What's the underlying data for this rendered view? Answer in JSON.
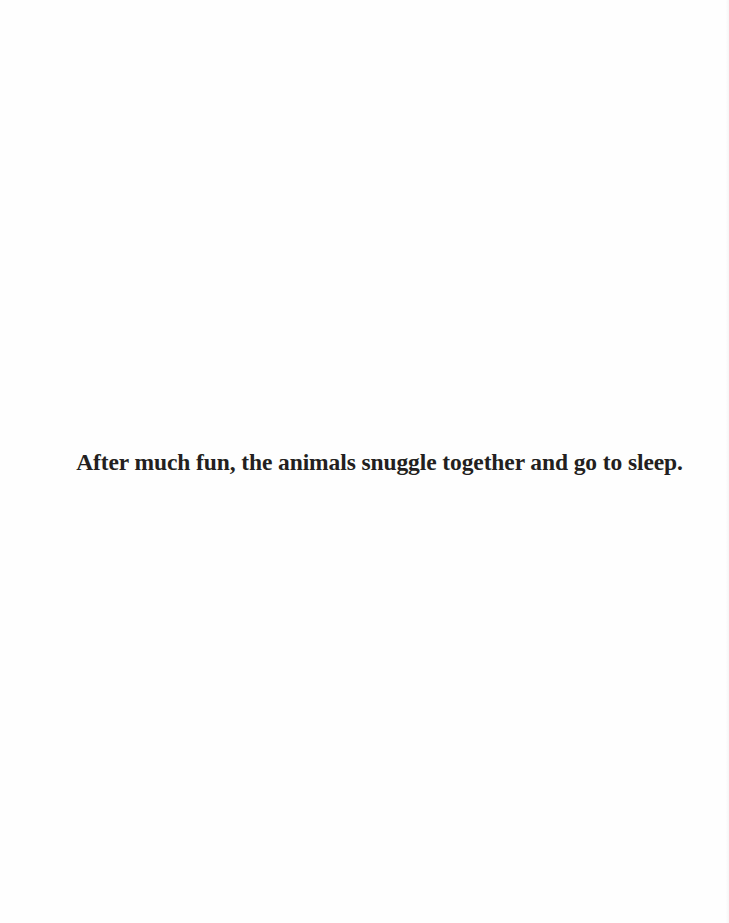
{
  "page": {
    "caption": "After much fun, the animals snuggle together and go to sleep.",
    "text_color": "#231f20",
    "background_color": "#fefefe"
  }
}
